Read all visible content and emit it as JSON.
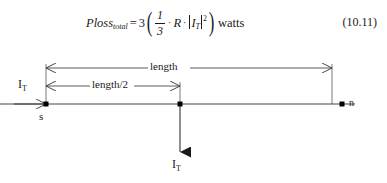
{
  "equation": {
    "lhs_name": "Ploss",
    "lhs_subscript": "total",
    "equals": "=",
    "coefficient": "3",
    "paren_open": "(",
    "paren_close": ")",
    "fraction_numerator": "1",
    "fraction_denominator": "3",
    "dot1": "·",
    "resistance": "R",
    "dot2": "·",
    "abs_open": "|",
    "current_symbol": "I",
    "current_subscript": "T",
    "abs_close": "|",
    "exponent": "2",
    "units": "watts",
    "number": "(10.11)"
  },
  "diagram": {
    "length_label": "length",
    "half_length_label": "length/2",
    "source_node_label": "s",
    "end_node_label": "n",
    "injected_current": {
      "symbol": "I",
      "subscript": "T"
    },
    "tapped_current": {
      "symbol": "I",
      "subscript": "T"
    },
    "line_color": "#333333",
    "node_color": "#000000"
  }
}
